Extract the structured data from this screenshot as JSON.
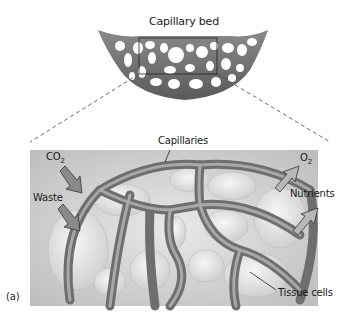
{
  "figure": {
    "panel_label": "(a)",
    "overview": {
      "title": "Capillary bed"
    },
    "detail": {
      "labels": {
        "capillaries": "Capillaries",
        "co2_main": "CO",
        "co2_sub": "2",
        "waste": "Waste",
        "o2_main": "O",
        "o2_sub": "2",
        "nutrients": "Nutrients",
        "tissue_cells": "Tissue cells"
      },
      "arrows": [
        {
          "name": "co2-arrow",
          "direction": "into-capillary"
        },
        {
          "name": "waste-arrow",
          "direction": "into-capillary"
        },
        {
          "name": "o2-arrow",
          "direction": "out-of-capillary"
        },
        {
          "name": "nutrients-arrow",
          "direction": "out-of-capillary"
        }
      ]
    },
    "colors": {
      "vessel": "#6e6e6e",
      "vessel_light": "#a8a8a8",
      "background_panel": "#d9d9d9",
      "cells": "#ececec",
      "arrow_in": "#8a8a8a",
      "arrow_out": "#b0b0b0"
    }
  }
}
